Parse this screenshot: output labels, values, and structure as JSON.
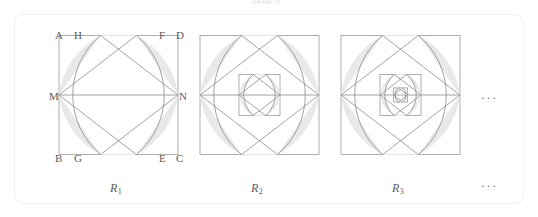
{
  "page": {
    "width": 538,
    "height": 217,
    "background": "#ffffff",
    "panel_border_color": "#f1f1f1",
    "cropped_top_text": "及图②"
  },
  "style": {
    "stroke_color": "#8a8a8a",
    "shade_color": "#e9e9e9",
    "label_color": "#5c5c5c",
    "square_stroke_color": "#9a9a9a",
    "stroke_width": 0.8
  },
  "figures": [
    {
      "id": "R1",
      "caption": "R",
      "caption_subscript": "1",
      "depth": 1,
      "square": {
        "cx": 118.5,
        "cy": 95.0,
        "half": 59.5
      },
      "vertex_labels": [
        {
          "name": "A",
          "text": "A",
          "x": 55,
          "y": 30,
          "corner": "top-left"
        },
        {
          "name": "H",
          "text": "H",
          "x": 74,
          "y": 30,
          "corner": "top"
        },
        {
          "name": "F",
          "text": "F",
          "x": 159,
          "y": 30,
          "corner": "top"
        },
        {
          "name": "D",
          "text": "D",
          "x": 176,
          "y": 30,
          "corner": "top-right"
        },
        {
          "name": "M",
          "text": "M",
          "x": 49,
          "y": 91,
          "corner": "left"
        },
        {
          "name": "N",
          "text": "N",
          "x": 179,
          "y": 91,
          "corner": "right"
        },
        {
          "name": "B",
          "text": "B",
          "x": 55,
          "y": 153,
          "corner": "bottom-left"
        },
        {
          "name": "G",
          "text": "G",
          "x": 74,
          "y": 153,
          "corner": "bottom"
        },
        {
          "name": "E",
          "text": "E",
          "x": 159,
          "y": 153,
          "corner": "bottom"
        },
        {
          "name": "C",
          "text": "C",
          "x": 176,
          "y": 153,
          "corner": "bottom-right"
        }
      ],
      "caption_pos": {
        "x": 110,
        "y": 182
      }
    },
    {
      "id": "R2",
      "caption": "R",
      "caption_subscript": "2",
      "depth": 2,
      "square": {
        "cx": 259.5,
        "cy": 95.0,
        "half": 59.5
      },
      "vertex_labels": [],
      "caption_pos": {
        "x": 251,
        "y": 182
      }
    },
    {
      "id": "R3",
      "caption": "R",
      "caption_subscript": "3",
      "depth": 3,
      "square": {
        "cx": 400.5,
        "cy": 95.0,
        "half": 59.5
      },
      "vertex_labels": [],
      "caption_pos": {
        "x": 392,
        "y": 182
      }
    }
  ],
  "ellipses": [
    {
      "name": "row-ellipsis",
      "text": "···",
      "x": 481,
      "y": 92
    },
    {
      "name": "caption-ellipsis",
      "text": "···",
      "x": 481,
      "y": 180
    }
  ]
}
